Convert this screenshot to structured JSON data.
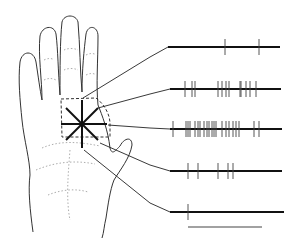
{
  "figure": {
    "colors": {
      "ink": "#1a1a1a",
      "light_ink": "#777777",
      "background": "#ffffff"
    }
  },
  "spike_trains": [
    {
      "label": "train-1",
      "y": 47,
      "x_start": 168,
      "x_end": 280,
      "spikes": [
        225,
        259
      ]
    },
    {
      "label": "train-2",
      "y": 89,
      "x_start": 170,
      "x_end": 281,
      "spikes": [
        185,
        192,
        195,
        218,
        222,
        226,
        229,
        240,
        241,
        246,
        250,
        256
      ]
    },
    {
      "label": "train-3",
      "y": 129,
      "x_start": 170,
      "x_end": 282,
      "spikes": [
        173,
        186,
        188,
        190,
        195,
        198,
        200,
        204,
        207,
        209,
        212,
        214,
        216,
        222,
        226,
        229,
        233,
        236,
        239,
        254,
        259
      ]
    },
    {
      "label": "train-4",
      "y": 171,
      "x_start": 170,
      "x_end": 282,
      "spikes": [
        188,
        198,
        218,
        228,
        233
      ]
    },
    {
      "label": "train-5",
      "y": 212,
      "x_start": 170,
      "x_end": 284,
      "spikes": [
        188
      ]
    }
  ],
  "scale_bar": {
    "x_start": 188,
    "x_end": 262,
    "y": 227
  }
}
